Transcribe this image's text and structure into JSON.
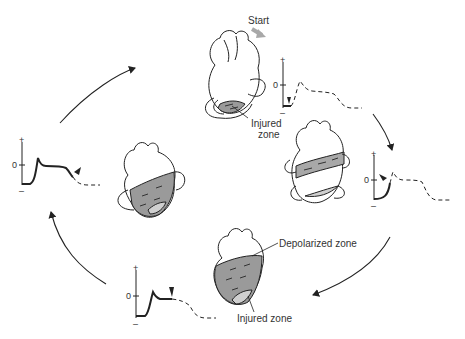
{
  "diagram": {
    "type": "cycle",
    "labels": {
      "start": "Start",
      "injured_zone_top": "Injured zone",
      "injured_zone_top_line1": "Injured",
      "injured_zone_top_line2": "zone",
      "depolarized_zone": "Depolarized zone",
      "injured_zone_bottom": "Injured zone"
    },
    "axis_labels": {
      "plus": "+",
      "zero": "0",
      "minus": "–"
    },
    "stages": [
      {
        "id": "stage-1",
        "position": "top",
        "heart": "injured zone shaded at apex with current loops",
        "trace": "baseline below zero, marker at start, dashed remainder"
      },
      {
        "id": "stage-2",
        "position": "right",
        "heart": "band of depolarization across mid-ventricle plus injured zone",
        "trace": "solid upstroke from below baseline, marker near zero, dashed remainder"
      },
      {
        "id": "stage-3",
        "position": "bottom",
        "heart": "ventricles depolarized, injured zone at apex",
        "trace": "solid upstroke and plateau, marker at end of plateau"
      },
      {
        "id": "stage-4",
        "position": "left",
        "heart": "depolarized region with injured zone, current loops",
        "trace": "solid full action potential with repolarization, marker at end"
      }
    ],
    "colors": {
      "line": "#222222",
      "shade": "#9a9a9a",
      "shade_light": "#cfcfcf",
      "start_arrow": "#a8a8a8"
    }
  }
}
